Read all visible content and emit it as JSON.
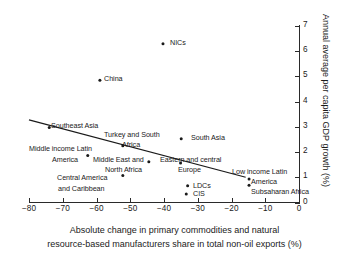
{
  "chart_data": {
    "type": "scatter",
    "title": "",
    "xlabel": "Absolute change in primary commodities and natural resource-based manufacturers share in total non-oil exports (%)",
    "xlabel_line1": "Absolute change in primary commodities and natural",
    "xlabel_line2": "resource-based manufacturers share in total non-oil exports (%)",
    "ylabel": "Annual average per capita GDP growth (%)",
    "xlim": [
      -85,
      2
    ],
    "ylim": [
      -0.2,
      7.3
    ],
    "xticks": [
      -80,
      -70,
      -60,
      -50,
      -40,
      -30,
      -20,
      -10,
      0
    ],
    "xtick_labels": [
      "−80",
      "−70",
      "−60",
      "−50",
      "−40",
      "−30",
      "−20",
      "−10",
      "0"
    ],
    "yticks": [
      0,
      1,
      2,
      3,
      4,
      5,
      6,
      7
    ],
    "ytick_labels": [
      "0",
      "1",
      "2",
      "3",
      "4",
      "5",
      "6",
      "7"
    ],
    "grid": false,
    "legend": "none",
    "y_axis_position": "right",
    "points": [
      {
        "label": "NICs",
        "x": -40.3,
        "y": 6.3,
        "label_pos": "right"
      },
      {
        "label": "China",
        "x": -59.0,
        "y": 4.85,
        "label_pos": "right"
      },
      {
        "label": "Southeast Asia",
        "x": -74.0,
        "y": 2.97,
        "label_pos": "right"
      },
      {
        "label": "Turkey and South Africa",
        "x": -52.2,
        "y": 2.25,
        "label_pos": "above-right"
      },
      {
        "label": "South Asia",
        "x": -34.9,
        "y": 2.53,
        "label_pos": "right"
      },
      {
        "label": "Middle income Latin America",
        "x": -62.6,
        "y": 1.86,
        "label_pos": "left"
      },
      {
        "label": "Middle East and North Africa",
        "x": -44.5,
        "y": 1.62,
        "label_pos": "below"
      },
      {
        "label": "Eastern and central Europe",
        "x": -35.1,
        "y": 1.57,
        "label_pos": "below"
      },
      {
        "label": "Central America and Caribbean",
        "x": -52.2,
        "y": 1.07,
        "label_pos": "below"
      },
      {
        "label": "LDCs",
        "x": -33.0,
        "y": 0.66,
        "label_pos": "right"
      },
      {
        "label": "CIS",
        "x": -33.4,
        "y": 0.34,
        "label_pos": "right"
      },
      {
        "label": "Low income Latin America",
        "x": -14.8,
        "y": 0.93,
        "label_pos": "right"
      },
      {
        "label": "Subsaharan Africa",
        "x": -14.8,
        "y": 0.68,
        "label_pos": "right"
      }
    ],
    "trendline": {
      "x_start": -80.0,
      "y_start": 3.28,
      "x_end": -15.8,
      "y_end": 1.0
    }
  },
  "colors": {
    "background": "#ffffff",
    "axis": "#2a2a2a",
    "marker": "#1a1a1a",
    "trend": "#1a1a1a",
    "text": "#1a1a1a"
  },
  "labels": {
    "nics": "NICs",
    "china": "China",
    "southeast_asia": "Southeast Asia",
    "turkey_line1": "Turkey and South",
    "turkey_line2": "Africa",
    "south_asia": "South Asia",
    "mi_latin_line1": "Middle income Latin",
    "mi_latin_line2": "America",
    "mena_line1": "Middle East and",
    "mena_line2": "North Africa",
    "ece_line1": "Eastern and central",
    "ece_line2": "Europe",
    "central_america_line1": "Central America",
    "central_america_line2": "and Caribbean",
    "ldcs": "LDCs",
    "cis": "CIS",
    "low_latin_line1": "Low income Latin",
    "low_latin_line2": "America",
    "subsaharan": "Subsaharan Africa"
  }
}
